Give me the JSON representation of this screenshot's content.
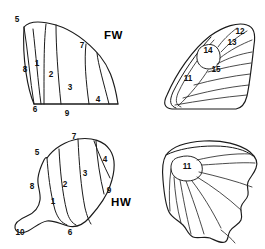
{
  "figure": {
    "background_color": "#ffffff",
    "line_color": "#1a1a1a",
    "width": 265,
    "height": 249
  },
  "panels": [
    {
      "id": "forewing-outline",
      "name": "Forewing cell map",
      "wing_label": "FW",
      "wing_label_pos": {
        "x": 104,
        "y": 36
      },
      "numbers": [
        {
          "value": "5",
          "x": 17,
          "y": 20
        },
        {
          "value": "8",
          "x": 25,
          "y": 70
        },
        {
          "value": "1",
          "x": 37,
          "y": 64
        },
        {
          "value": "2",
          "x": 51,
          "y": 75
        },
        {
          "value": "7",
          "x": 82,
          "y": 46
        },
        {
          "value": "3",
          "x": 70,
          "y": 88
        },
        {
          "value": "4",
          "x": 98,
          "y": 100
        },
        {
          "value": "6",
          "x": 35,
          "y": 110
        },
        {
          "value": "9",
          "x": 67,
          "y": 114
        }
      ]
    },
    {
      "id": "forewing-venation",
      "name": "Forewing venation",
      "numbers": [
        {
          "value": "12",
          "x": 240,
          "y": 32
        },
        {
          "value": "13",
          "x": 232,
          "y": 43
        },
        {
          "value": "14",
          "x": 208,
          "y": 51
        },
        {
          "value": "15",
          "x": 216,
          "y": 70
        },
        {
          "value": "11",
          "x": 188,
          "y": 79
        }
      ]
    },
    {
      "id": "hindwing-outline",
      "name": "Hindwing cell map",
      "wing_label": "HW",
      "wing_label_pos": {
        "x": 111,
        "y": 203
      },
      "numbers": [
        {
          "value": "7",
          "x": 74,
          "y": 137
        },
        {
          "value": "5",
          "x": 37,
          "y": 153
        },
        {
          "value": "4",
          "x": 105,
          "y": 160
        },
        {
          "value": "3",
          "x": 85,
          "y": 174
        },
        {
          "value": "8",
          "x": 32,
          "y": 187
        },
        {
          "value": "2",
          "x": 65,
          "y": 185
        },
        {
          "value": "9",
          "x": 109,
          "y": 191
        },
        {
          "value": "1",
          "x": 53,
          "y": 202
        },
        {
          "value": "10",
          "x": 20,
          "y": 233
        },
        {
          "value": "6",
          "x": 70,
          "y": 233
        }
      ]
    },
    {
      "id": "hindwing-venation",
      "name": "Hindwing venation",
      "numbers": [
        {
          "value": "11",
          "x": 187,
          "y": 167
        }
      ]
    }
  ]
}
